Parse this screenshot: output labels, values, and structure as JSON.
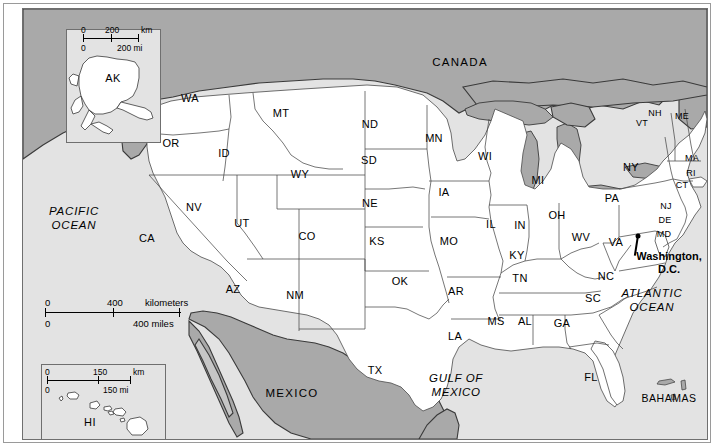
{
  "map": {
    "title": "United States Reference Map",
    "colors": {
      "page_background": "#ffffff",
      "ocean": "#e3e3e3",
      "land_usa": "#ffffff",
      "foreign_land": "#a9a9a9",
      "lakes": "#a9a9a9",
      "border_line": "#4a4a4a",
      "frame": "#6f6f6f",
      "label_text": "#000000"
    },
    "states": [
      {
        "code": "WA",
        "name": "Washington",
        "x": 189,
        "y": 97
      },
      {
        "code": "OR",
        "name": "Oregon",
        "x": 170,
        "y": 142
      },
      {
        "code": "CA",
        "name": "California",
        "x": 146,
        "y": 237
      },
      {
        "code": "NV",
        "name": "Nevada",
        "x": 193,
        "y": 206
      },
      {
        "code": "ID",
        "name": "Idaho",
        "x": 223,
        "y": 152
      },
      {
        "code": "MT",
        "name": "Montana",
        "x": 280,
        "y": 112
      },
      {
        "code": "WY",
        "name": "Wyoming",
        "x": 299,
        "y": 173
      },
      {
        "code": "UT",
        "name": "Utah",
        "x": 241,
        "y": 222
      },
      {
        "code": "AZ",
        "name": "Arizona",
        "x": 232,
        "y": 288
      },
      {
        "code": "CO",
        "name": "Colorado",
        "x": 306,
        "y": 235
      },
      {
        "code": "NM",
        "name": "New Mexico",
        "x": 294,
        "y": 294
      },
      {
        "code": "ND",
        "name": "North Dakota",
        "x": 369,
        "y": 123
      },
      {
        "code": "SD",
        "name": "South Dakota",
        "x": 368,
        "y": 159
      },
      {
        "code": "NE",
        "name": "Nebraska",
        "x": 369,
        "y": 202
      },
      {
        "code": "KS",
        "name": "Kansas",
        "x": 376,
        "y": 240
      },
      {
        "code": "OK",
        "name": "Oklahoma",
        "x": 399,
        "y": 280
      },
      {
        "code": "TX",
        "name": "Texas",
        "x": 374,
        "y": 369
      },
      {
        "code": "MN",
        "name": "Minnesota",
        "x": 433,
        "y": 137
      },
      {
        "code": "IA",
        "name": "Iowa",
        "x": 443,
        "y": 191
      },
      {
        "code": "MO",
        "name": "Missouri",
        "x": 448,
        "y": 240
      },
      {
        "code": "AR",
        "name": "Arkansas",
        "x": 455,
        "y": 290
      },
      {
        "code": "LA",
        "name": "Louisiana",
        "x": 454,
        "y": 335
      },
      {
        "code": "WI",
        "name": "Wisconsin",
        "x": 484,
        "y": 155
      },
      {
        "code": "IL",
        "name": "Illinois",
        "x": 490,
        "y": 223
      },
      {
        "code": "MS",
        "name": "Mississippi",
        "x": 495,
        "y": 320
      },
      {
        "code": "IN",
        "name": "Indiana",
        "x": 519,
        "y": 224
      },
      {
        "code": "MI",
        "name": "Michigan",
        "x": 537,
        "y": 179
      },
      {
        "code": "AL",
        "name": "Alabama",
        "x": 524,
        "y": 320
      },
      {
        "code": "TN",
        "name": "Tennessee",
        "x": 519,
        "y": 277
      },
      {
        "code": "KY",
        "name": "Kentucky",
        "x": 516,
        "y": 254
      },
      {
        "code": "OH",
        "name": "Ohio",
        "x": 556,
        "y": 214
      },
      {
        "code": "GA",
        "name": "Georgia",
        "x": 561,
        "y": 322
      },
      {
        "code": "FL",
        "name": "Florida",
        "x": 590,
        "y": 376
      },
      {
        "code": "SC",
        "name": "South Carolina",
        "x": 592,
        "y": 297
      },
      {
        "code": "NC",
        "name": "North Carolina",
        "x": 605,
        "y": 275
      },
      {
        "code": "WV",
        "name": "West Virginia",
        "x": 580,
        "y": 236
      },
      {
        "code": "VA",
        "name": "Virginia",
        "x": 615,
        "y": 241
      },
      {
        "code": "PA",
        "name": "Pennsylvania",
        "x": 611,
        "y": 197
      },
      {
        "code": "NY",
        "name": "New York",
        "x": 630,
        "y": 166
      },
      {
        "code": "VT",
        "name": "Vermont",
        "x": 641,
        "y": 122,
        "size": "sm"
      },
      {
        "code": "NH",
        "name": "New Hampshire",
        "x": 654,
        "y": 112,
        "size": "sm"
      },
      {
        "code": "ME",
        "name": "Maine",
        "x": 681,
        "y": 115,
        "size": "sm"
      },
      {
        "code": "MA",
        "name": "Massachusetts",
        "x": 691,
        "y": 157,
        "size": "sm"
      },
      {
        "code": "RI",
        "name": "Rhode Island",
        "x": 690,
        "y": 172,
        "size": "sm"
      },
      {
        "code": "CT",
        "name": "Connecticut",
        "x": 681,
        "y": 184,
        "size": "sm"
      },
      {
        "code": "NJ",
        "name": "New Jersey",
        "x": 665,
        "y": 205,
        "size": "sm"
      },
      {
        "code": "DE",
        "name": "Delaware",
        "x": 664,
        "y": 219,
        "size": "sm"
      },
      {
        "code": "MD",
        "name": "Maryland",
        "x": 663,
        "y": 233,
        "size": "sm"
      },
      {
        "code": "AK",
        "name": "Alaska",
        "x": 65,
        "y": 70,
        "inset": "alaska"
      },
      {
        "code": "HI",
        "name": "Hawaii",
        "x": 66,
        "y": 412,
        "inset": "hawaii"
      }
    ],
    "countries": [
      {
        "label": "CANADA",
        "x": 459,
        "y": 62
      },
      {
        "label": "MEXICO",
        "x": 291,
        "y": 393
      }
    ],
    "water_labels": [
      {
        "label": "PACIFIC\nOCEAN",
        "line1": "PACIFIC",
        "line2": "OCEAN",
        "x": 73,
        "y": 218
      },
      {
        "label": "ATLANTIC\nOCEAN",
        "line1": "ATLANTIC",
        "line2": "OCEAN",
        "x": 651,
        "y": 300
      },
      {
        "label": "GULF OF\nMEXICO",
        "line1": "GULF OF",
        "line2": "MEXICO",
        "x": 455,
        "y": 385
      }
    ],
    "islands": [
      {
        "label": "BAHAMAS",
        "x": 668,
        "y": 397
      }
    ],
    "capital": {
      "label_line1": "Washington,",
      "label_line2": "D.C.",
      "label_x": 668,
      "label_y": 262,
      "marker_x": 637,
      "marker_y": 235
    },
    "scales": [
      {
        "id": "scale-main",
        "top_start": "0",
        "top_mid": "400",
        "top_unit": "kilometers",
        "bottom_start": "0",
        "bottom_end": "400 miles"
      },
      {
        "id": "scale-alaska",
        "top_start": "0",
        "top_mid": "200",
        "top_unit": "km",
        "bottom_start": "0",
        "bottom_end": "200 mi"
      },
      {
        "id": "scale-hawaii",
        "top_start": "0",
        "top_mid": "150",
        "top_unit": "km",
        "bottom_start": "0",
        "bottom_end": "150 mi"
      }
    ],
    "insets": [
      {
        "id": "inset-alaska",
        "name": "Alaska inset"
      },
      {
        "id": "inset-hawaii",
        "name": "Hawaii inset"
      }
    ]
  }
}
